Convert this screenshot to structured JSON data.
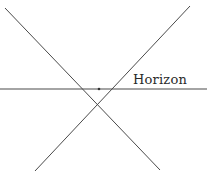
{
  "diagram": {
    "label": "Horizon",
    "line_color": "#4a4a4a",
    "lines": [
      {
        "name": "horizon-line",
        "x1": 0,
        "y1": 89,
        "x2": 207,
        "y2": 89
      },
      {
        "name": "diagonal-descending",
        "x1": 5,
        "y1": 8,
        "x2": 160,
        "y2": 170
      },
      {
        "name": "diagonal-ascending",
        "x1": 190,
        "y1": 6,
        "x2": 35,
        "y2": 171
      }
    ],
    "intersection": {
      "x": 99,
      "y": 89
    }
  }
}
